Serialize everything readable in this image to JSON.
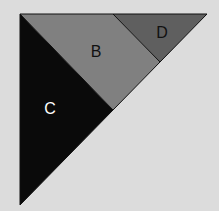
{
  "diagram": {
    "background": "#dcdcdc",
    "regions": [
      {
        "id": "C",
        "label": "C",
        "fill": "#0a0a0a",
        "label_color": "#ffffff",
        "points": "20,14 113,110 20,205",
        "label_pos": [
          50,
          114
        ]
      },
      {
        "id": "B",
        "label": "B",
        "fill": "#808080",
        "label_color": "#111111",
        "points": "20,14 113,14 160,62 113,110",
        "label_pos": [
          96,
          57
        ]
      },
      {
        "id": "D",
        "label": "D",
        "fill": "#5f5f5f",
        "label_color": "#111111",
        "points": "113,14 207,14 160,62",
        "label_pos": [
          162,
          38
        ]
      }
    ],
    "outline_color": "#111111"
  }
}
